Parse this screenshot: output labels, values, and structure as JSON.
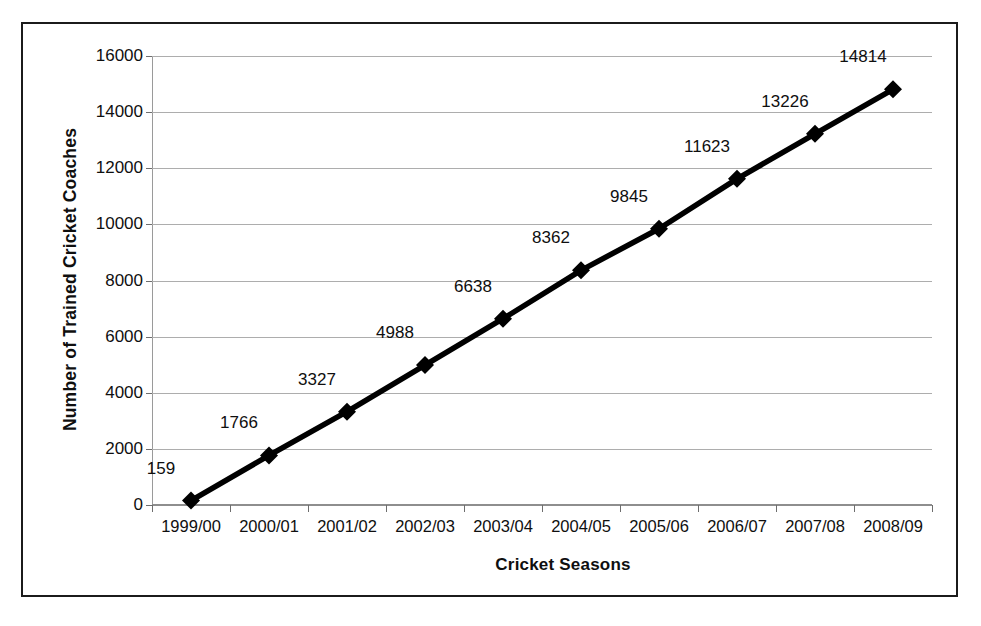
{
  "chart_data": {
    "type": "line",
    "title": "",
    "xlabel": "Cricket Seasons",
    "ylabel": "Number of Trained Cricket Coaches",
    "categories": [
      "1999/00",
      "2000/01",
      "2001/02",
      "2002/03",
      "2003/04",
      "2004/05",
      "2005/06",
      "2006/07",
      "2007/08",
      "2008/09"
    ],
    "values": [
      159,
      1766,
      3327,
      4988,
      6638,
      8362,
      9845,
      11623,
      13226,
      14814
    ],
    "data_labels": [
      "159",
      "1766",
      "3327",
      "4988",
      "6638",
      "8362",
      "9845",
      "11623",
      "13226",
      "14814"
    ],
    "ylim": [
      0,
      16000
    ],
    "y_tick_step": 2000,
    "y_ticks": [
      0,
      2000,
      4000,
      6000,
      8000,
      10000,
      12000,
      14000,
      16000
    ],
    "y_tick_labels": [
      "0",
      "2000",
      "4000",
      "6000",
      "8000",
      "10000",
      "12000",
      "14000",
      "16000"
    ],
    "grid": "horizontal",
    "legend": "none",
    "marker": "diamond",
    "series_color": "#000000",
    "grid_color": "#adadad",
    "frame_color": "#1b1b1b",
    "background": "#ffffff"
  }
}
